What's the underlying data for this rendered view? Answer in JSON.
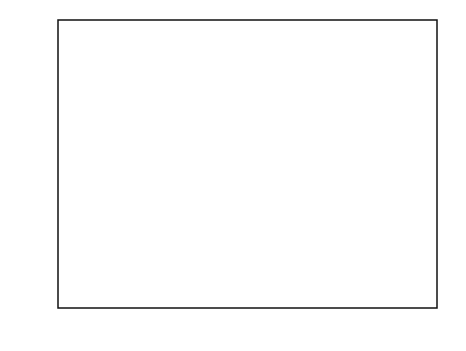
{
  "chart_data": {
    "type": "line",
    "title": "",
    "xlabel": "Z = 8.68/NOx + 99.23/NMOC",
    "xlabel_parts": {
      "pre": "Z  =  8.68/NO",
      "sub": "x",
      "post": " + 99.23/NMOC"
    },
    "ylabel": "PROBABILITY",
    "xlim": [
      0,
      1.4
    ],
    "ylim": [
      0,
      1.0
    ],
    "x_ticks_major": [
      "0",
      "0.2",
      "0.4",
      "0.6",
      "0.8",
      "1.0",
      "1.2",
      "1.4"
    ],
    "x_tick_values_major": [
      0,
      0.2,
      0.4,
      0.6,
      0.8,
      1.0,
      1.2,
      1.4
    ],
    "x_tick_values_minor": [
      0.1,
      0.3,
      0.5,
      0.7,
      0.9,
      1.1,
      1.3
    ],
    "y_ticks_major": [
      "0",
      "0.2",
      "0.4",
      "0.6",
      "0.8",
      "1.0"
    ],
    "y_tick_values_major": [
      0,
      0.2,
      0.4,
      0.6,
      0.8,
      1.0
    ],
    "y_tick_values_minor": [
      0.1,
      0.3,
      0.5,
      0.7,
      0.9
    ],
    "grid": false,
    "legend_position": "inline-annotations",
    "series": [
      {
        "name": "P(R<0.8)",
        "comment": "decreasing sigmoid from 1.0 at Z=0 to 0 near Z=0.95",
        "x": [
          0.0,
          0.05,
          0.1,
          0.15,
          0.2,
          0.25,
          0.3,
          0.35,
          0.4,
          0.45,
          0.5,
          0.55,
          0.6,
          0.65,
          0.7,
          0.75,
          0.8,
          0.85,
          0.9,
          0.95,
          1.0,
          1.05,
          1.1
        ],
        "values": [
          1.0,
          1.0,
          0.999,
          0.996,
          0.99,
          0.978,
          0.958,
          0.925,
          0.875,
          0.8,
          0.7,
          0.58,
          0.45,
          0.325,
          0.215,
          0.13,
          0.072,
          0.036,
          0.016,
          0.006,
          0.002,
          0.001,
          0.0
        ]
      },
      {
        "name": "P(0.8<=R<=1.2)",
        "comment": "bell-shaped curve peaking near Z=0.70 at about 0.82",
        "x": [
          0.1,
          0.15,
          0.2,
          0.25,
          0.3,
          0.35,
          0.4,
          0.45,
          0.5,
          0.55,
          0.6,
          0.65,
          0.7,
          0.75,
          0.8,
          0.85,
          0.9,
          0.95,
          1.0,
          1.05
        ],
        "values": [
          0.0,
          0.003,
          0.01,
          0.025,
          0.055,
          0.11,
          0.2,
          0.33,
          0.49,
          0.64,
          0.76,
          0.815,
          0.822,
          0.78,
          0.68,
          0.53,
          0.36,
          0.2,
          0.085,
          0.02
        ]
      },
      {
        "name": "P(R>1.2)",
        "comment": "increasing sigmoid from 0 near Z=0.55 to 1.0 at Z=1.4",
        "x": [
          0.5,
          0.55,
          0.6,
          0.65,
          0.7,
          0.75,
          0.8,
          0.85,
          0.9,
          0.95,
          1.0,
          1.05,
          1.1,
          1.15,
          1.2,
          1.25,
          1.3,
          1.35,
          1.4
        ],
        "values": [
          0.0,
          0.002,
          0.008,
          0.022,
          0.05,
          0.105,
          0.195,
          0.33,
          0.49,
          0.65,
          0.78,
          0.87,
          0.93,
          0.965,
          0.983,
          0.993,
          0.997,
          0.999,
          1.0
        ]
      }
    ],
    "annotations": [
      {
        "label": "P(R<0.8)",
        "x_text": 0.115,
        "y_text": 0.815,
        "point_x": 0.39,
        "point_y": 0.885
      },
      {
        "label": "P(0.8≤R≤1.2)",
        "x_text": 0.445,
        "y_text": 0.945,
        "point_x": 0.655,
        "point_y": 0.835
      },
      {
        "label": "P(R>1.2)",
        "x_text": 1.105,
        "y_text": 0.815,
        "point_x": 1.0,
        "point_y": 0.865
      }
    ],
    "reference_lines": [
      {
        "orientation": "horizontal",
        "value": 0.7,
        "style": "dashed",
        "from_x": 0.0,
        "to_x": 0.82
      },
      {
        "orientation": "vertical",
        "value": 0.82,
        "style": "dashed",
        "from_y": 0.0,
        "to_y": 0.7
      }
    ],
    "shaded_region": {
      "label": "P(0.8≤R≤1.2) area",
      "series": "P(0.8<=R<=1.2)",
      "x_from": 0.527,
      "x_to": 0.818,
      "y_base": 0.7,
      "pattern": "diagonal-hatch"
    }
  }
}
